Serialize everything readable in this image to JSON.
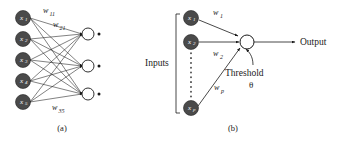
{
  "figure": {
    "background_color": "#ffffff",
    "line_color": "#1a1a1a",
    "input_node_fill": "#4a4a4a",
    "output_node_fill": "#ffffff",
    "panels": [
      {
        "id": "a",
        "caption": "(a)",
        "type": "multilayer-network",
        "input_nodes": [
          {
            "label": "x",
            "sub": "1"
          },
          {
            "label": "x",
            "sub": "2"
          },
          {
            "label": "x",
            "sub": "3"
          },
          {
            "label": "x",
            "sub": "4"
          },
          {
            "label": "x",
            "sub": "5"
          }
        ],
        "output_nodes": 3,
        "weight_labels": [
          {
            "label": "w",
            "sub": "11"
          },
          {
            "label": "w",
            "sub": "21"
          },
          {
            "label": "w",
            "sub": "35"
          }
        ]
      },
      {
        "id": "b",
        "caption": "(b)",
        "type": "single-neuron",
        "inputs_bracket_label": "Inputs",
        "input_nodes": [
          {
            "label": "x",
            "sub": "1"
          },
          {
            "label": "x",
            "sub": "2"
          },
          {
            "label": "x",
            "sub": "p"
          }
        ],
        "weight_labels": [
          {
            "label": "w",
            "sub": "1"
          },
          {
            "label": "w",
            "sub": "2"
          },
          {
            "label": "w",
            "sub": "p"
          }
        ],
        "threshold_label": "Threshold",
        "threshold_symbol": "θ",
        "output_label": "Output"
      }
    ]
  }
}
